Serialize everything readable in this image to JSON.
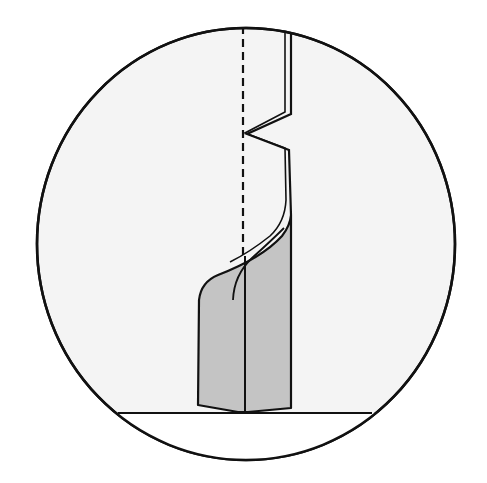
{
  "diagram": {
    "type": "folding-step-illustration",
    "frame": {
      "shape": "circle",
      "cx": 246,
      "cy": 244,
      "rx": 209,
      "ry": 216,
      "fill": "#f4f4f4",
      "stroke": "#111111"
    },
    "colors": {
      "background": "#ffffff",
      "circle_fill": "#f4f4f4",
      "paper_shaded": "#c4c4c4",
      "line": "#111111"
    },
    "elements": [
      {
        "name": "fold-line-valley",
        "style": "dashed",
        "x": 243,
        "y1": 28,
        "y2": 255
      },
      {
        "name": "upper-strip-edge",
        "style": "double-line",
        "description": "vertical strip with zigzag pleat"
      },
      {
        "name": "shaded-base-flap",
        "style": "filled",
        "description": "gray folded base with curved top"
      },
      {
        "name": "ground-line",
        "y": 413,
        "x1": 120,
        "x2": 370
      }
    ]
  }
}
